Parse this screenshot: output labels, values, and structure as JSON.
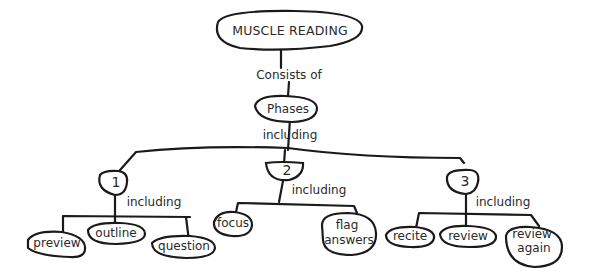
{
  "diagram": {
    "type": "concept-map",
    "root": {
      "label": "MUSCLE READING"
    },
    "edge_consists": "Consists of",
    "phases": {
      "label": "Phases"
    },
    "edge_including_main": "including",
    "phase_nodes": [
      {
        "label": "1",
        "edge": "including",
        "children": [
          "preview",
          "outline",
          "question"
        ]
      },
      {
        "label": "2",
        "edge": "including",
        "children": [
          "focus",
          "flag answers"
        ]
      },
      {
        "label": "3",
        "edge": "including",
        "children": [
          "recite",
          "review",
          "review again"
        ]
      }
    ],
    "colors": {
      "ink": "#1a1a1a",
      "background": "#ffffff"
    }
  }
}
